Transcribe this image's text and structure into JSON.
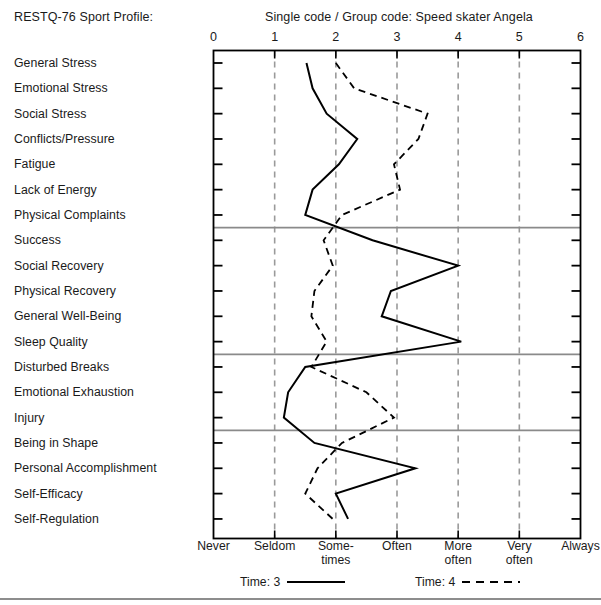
{
  "header": {
    "left_title": "RESTQ-76 Sport Profile:",
    "right_title": "Single code  /  Group code: Speed skater Angela"
  },
  "legend": {
    "series1_label": "Time: 3",
    "series2_label": "Time: 4",
    "series1_style": "solid",
    "series2_style": "dashed",
    "series1_color": "#000000",
    "series2_color": "#000000"
  },
  "axis": {
    "top_ticks": [
      "0",
      "1",
      "2",
      "3",
      "4",
      "5",
      "6"
    ],
    "scale_labels": [
      "Never",
      "Seldom",
      "Some-\ntimes",
      "Often",
      "More\noften",
      "Very\noften",
      "Always"
    ]
  },
  "chart_data": {
    "type": "line",
    "title": "RESTQ-76 Sport Profile: Single code  /  Group code: Speed skater Angela",
    "xlabel": "",
    "ylabel": "",
    "xlim": [
      0,
      6
    ],
    "grid": true,
    "orientation": "horizontal-value-vertical-category",
    "legend_position": "bottom",
    "xtick_labels": [
      "0",
      "1",
      "2",
      "3",
      "4",
      "5",
      "6"
    ],
    "xtick_text": [
      "Never",
      "Seldom",
      "Some-times",
      "Often",
      "More often",
      "Very often",
      "Always"
    ],
    "categories": [
      "General Stress",
      "Emotional Stress",
      "Social Stress",
      "Conflicts/Pressure",
      "Fatigue",
      "Lack of Energy",
      "Physical Complaints",
      "Success",
      "Social Recovery",
      "Physical Recovery",
      "General Well-Being",
      "Sleep Quality",
      "Disturbed Breaks",
      "Emotional Exhaustion",
      "Injury",
      "Being in Shape",
      "Personal Accomplishment",
      "Self-Efficacy",
      "Self-Regulation"
    ],
    "group_separators_after": [
      "Physical Complaints",
      "Sleep Quality",
      "Injury"
    ],
    "series": [
      {
        "name": "Time: 3",
        "style": "solid",
        "values": [
          1.52,
          1.62,
          1.85,
          2.35,
          2.05,
          1.62,
          1.5,
          2.6,
          4.0,
          2.9,
          2.75,
          4.05,
          1.5,
          1.22,
          1.15,
          1.65,
          3.3,
          2.0,
          2.2
        ]
      },
      {
        "name": "Time: 4",
        "style": "dashed",
        "values": [
          2.0,
          2.3,
          3.5,
          3.35,
          2.95,
          3.05,
          2.1,
          1.8,
          1.95,
          1.65,
          1.6,
          1.85,
          1.6,
          2.5,
          2.95,
          2.1,
          1.7,
          1.5,
          1.95
        ]
      }
    ]
  }
}
